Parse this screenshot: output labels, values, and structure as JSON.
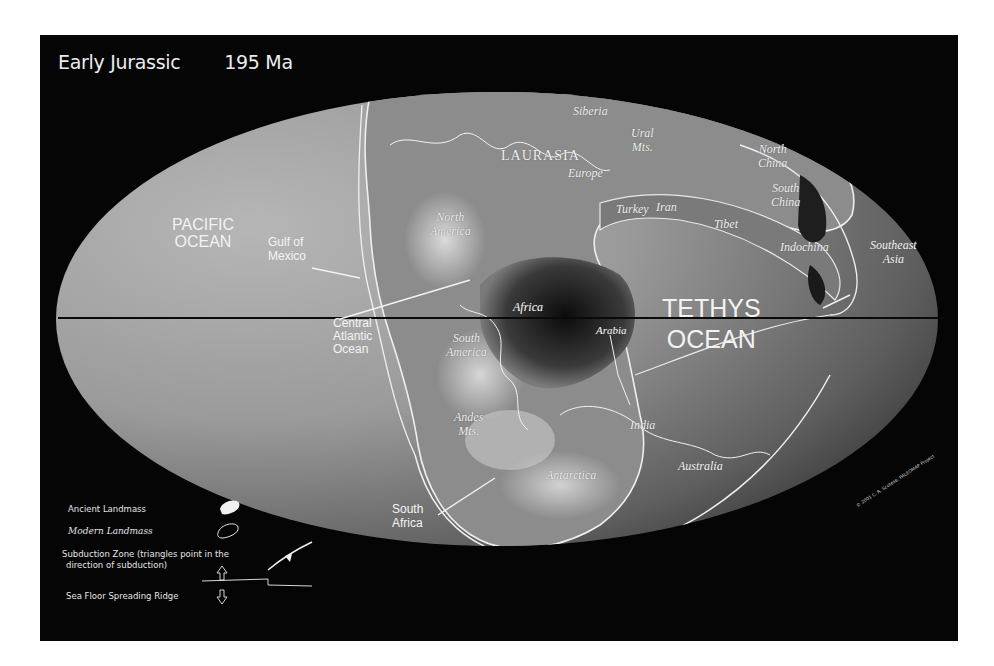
{
  "map": {
    "title": "Early Jurassic",
    "age": "195 Ma",
    "oceans": [
      {
        "id": "pacific",
        "lines": [
          "PACIFIC",
          "OCEAN"
        ]
      },
      {
        "id": "tethys",
        "lines": [
          "TETHYS",
          "OCEAN"
        ]
      }
    ],
    "sans_labels": {
      "gulf_of_mexico": [
        "Gulf of",
        "Mexico"
      ],
      "central_atlantic": [
        "Central",
        "Atlantic",
        "Ocean"
      ],
      "south_africa": [
        "South",
        "Africa"
      ]
    },
    "region_labels": {
      "laurasia": "LAURASIA",
      "siberia": "Siberia",
      "ural": [
        "Ural",
        "Mts."
      ],
      "europe": "Europe",
      "turkey": "Turkey",
      "iran": "Iran",
      "tibet": "Tibet",
      "north_china": [
        "North",
        "China"
      ],
      "south_china": [
        "South",
        "China"
      ],
      "indochina": "Indochina",
      "southeast_asia": [
        "Southeast",
        "Asia"
      ],
      "north_america": [
        "North",
        "America"
      ],
      "africa": "Africa",
      "arabia": "Arabia",
      "south_america": [
        "South",
        "America"
      ],
      "andes": [
        "Andes",
        "Mts."
      ],
      "india": "India",
      "antarctica": "Antarctica",
      "australia": "Australia"
    },
    "copyright": "© 2001  C. R. Scotese, PALEOMAP Project"
  },
  "legend": {
    "ancient_landmass": "Ancient Landmass",
    "modern_landmass": "Modern Landmass",
    "subduction_line1": "Subduction Zone  (triangles point in the",
    "subduction_line2": "direction of subduction)",
    "ridge": "Sea Floor Spreading Ridge"
  },
  "colors": {
    "background": "#050505",
    "ocean_light": "#a8a8a8",
    "ocean_dark": "#3a3a3a",
    "outline": "#f0f0f0"
  }
}
